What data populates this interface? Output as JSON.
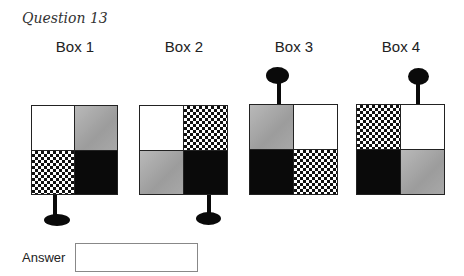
{
  "question": {
    "title": "Question 13"
  },
  "boxes": [
    {
      "label": "Box 1",
      "quadrants": [
        "white",
        "gray",
        "checker",
        "black"
      ],
      "handle": "bottom-left"
    },
    {
      "label": "Box 2",
      "quadrants": [
        "white",
        "checker",
        "gray",
        "black"
      ],
      "handle": "bottom-right"
    },
    {
      "label": "Box 3",
      "quadrants": [
        "gray",
        "white",
        "black",
        "checker"
      ],
      "handle": "top-left"
    },
    {
      "label": "Box 4",
      "quadrants": [
        "checker",
        "white",
        "black",
        "gray"
      ],
      "handle": "top-right"
    }
  ],
  "answer": {
    "label": "Answer",
    "value": "",
    "placeholder": ""
  }
}
